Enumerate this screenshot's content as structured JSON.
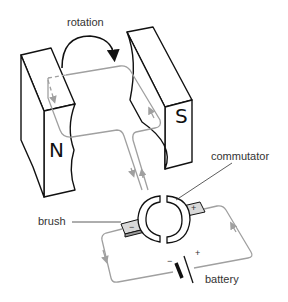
{
  "labels": {
    "rotation": "rotation",
    "commutator": "commutator",
    "brush": "brush",
    "battery": "battery"
  },
  "poles": {
    "north": "N",
    "south": "S"
  },
  "terminals": {
    "negative": "−",
    "positive": "+"
  },
  "battery_terminals": {
    "negative": "−",
    "positive": "+"
  },
  "colors": {
    "outline": "#111111",
    "wire": "#a0a0a0",
    "brush_fill": "#d9d9d9",
    "text": "#333333"
  }
}
